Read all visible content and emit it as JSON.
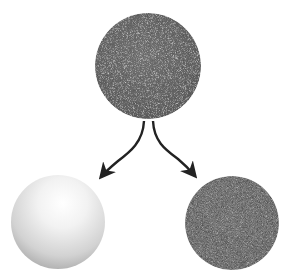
{
  "diagram": {
    "nodes": [
      {
        "id": "source",
        "label": "",
        "kind": "noisy-textured-sphere",
        "color": "#6a6a6a"
      },
      {
        "id": "left-result",
        "label": "",
        "kind": "glossy-white-sphere",
        "color": "#e6e6e6"
      },
      {
        "id": "right-result",
        "label": "",
        "kind": "matte-dark-sphere",
        "color": "#4a4a4a"
      }
    ],
    "edges": [
      {
        "from": "source",
        "to": "left-result",
        "style": "curved-arrow",
        "color": "#222222"
      },
      {
        "from": "source",
        "to": "right-result",
        "style": "curved-arrow",
        "color": "#222222"
      }
    ]
  }
}
